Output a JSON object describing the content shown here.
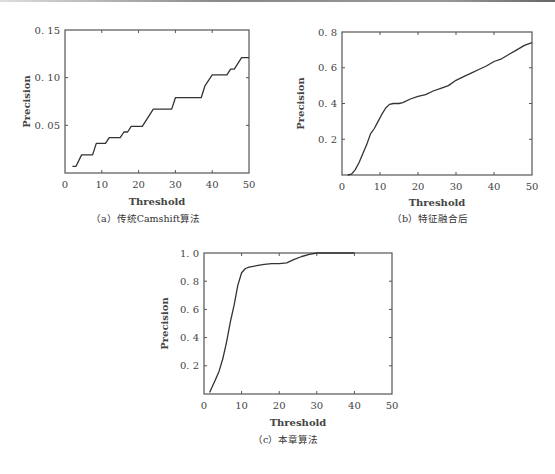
{
  "chart_data": [
    {
      "id": "a",
      "type": "line",
      "caption": "（a）传统Camshift算法",
      "xlabel": "Threshold",
      "ylabel": "Precision",
      "xlim": [
        0,
        50
      ],
      "ylim": [
        0,
        0.15
      ],
      "xticks": [
        "0",
        "10",
        "20",
        "30",
        "40",
        "50"
      ],
      "yticks": [
        "0. 05",
        "0. 10",
        "0. 15"
      ],
      "ytick_values": [
        0.05,
        0.1,
        0.15
      ],
      "grid": false,
      "x": [
        2,
        3,
        4.5,
        7.5,
        8.5,
        11,
        12,
        15,
        16,
        17,
        18,
        21,
        24,
        29,
        30,
        37,
        38,
        40,
        44,
        45,
        46,
        48,
        50
      ],
      "y": [
        0.007,
        0.007,
        0.019,
        0.019,
        0.031,
        0.031,
        0.037,
        0.037,
        0.043,
        0.043,
        0.049,
        0.049,
        0.067,
        0.067,
        0.079,
        0.079,
        0.091,
        0.103,
        0.103,
        0.109,
        0.109,
        0.121,
        0.121
      ]
    },
    {
      "id": "b",
      "type": "line",
      "caption": "（b）特征融合后",
      "xlabel": "Threshold",
      "ylabel": "Precision",
      "xlim": [
        0,
        50
      ],
      "ylim": [
        0,
        0.8
      ],
      "xticks": [
        "0",
        "10",
        "20",
        "30",
        "40",
        "50"
      ],
      "yticks": [
        "0. 2",
        "0. 4",
        "0. 6",
        "0. 8"
      ],
      "ytick_values": [
        0.2,
        0.4,
        0.6,
        0.8
      ],
      "grid": false,
      "x": [
        1.5,
        2.5,
        3.5,
        4.5,
        5.5,
        6.5,
        7.5,
        8.5,
        9.5,
        10.5,
        11.5,
        12.5,
        13.5,
        15,
        16,
        18,
        20,
        22,
        24,
        26,
        28,
        30,
        32,
        34,
        36,
        38,
        40,
        42,
        44,
        46,
        48,
        50
      ],
      "y": [
        0.0,
        0.005,
        0.03,
        0.07,
        0.12,
        0.17,
        0.23,
        0.26,
        0.3,
        0.34,
        0.375,
        0.395,
        0.4,
        0.4,
        0.405,
        0.425,
        0.44,
        0.45,
        0.47,
        0.485,
        0.5,
        0.53,
        0.55,
        0.57,
        0.59,
        0.61,
        0.635,
        0.65,
        0.675,
        0.7,
        0.725,
        0.74
      ]
    },
    {
      "id": "c",
      "type": "line",
      "caption": "（c）本章算法",
      "xlabel": "Threshold",
      "ylabel": "Precision",
      "xlim": [
        0,
        50
      ],
      "ylim": [
        0,
        1.0
      ],
      "xticks": [
        "0",
        "10",
        "20",
        "30",
        "40",
        "50"
      ],
      "yticks": [
        "0. 2",
        "0. 4",
        "0. 6",
        "0. 8",
        "1. 0"
      ],
      "ytick_values": [
        0.2,
        0.4,
        0.6,
        0.8,
        1.0
      ],
      "grid": false,
      "x": [
        1.5,
        3,
        4,
        5,
        6,
        7,
        8,
        9,
        10,
        11,
        12,
        14,
        16,
        18,
        20,
        22,
        24,
        26,
        28,
        30,
        35,
        40
      ],
      "y": [
        0.01,
        0.1,
        0.16,
        0.25,
        0.37,
        0.51,
        0.63,
        0.77,
        0.86,
        0.89,
        0.9,
        0.91,
        0.92,
        0.925,
        0.925,
        0.93,
        0.955,
        0.975,
        0.99,
        1.0,
        1.0,
        1.0
      ]
    }
  ]
}
